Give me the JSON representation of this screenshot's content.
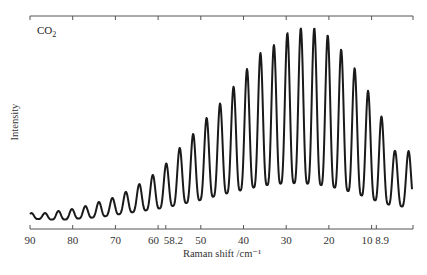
{
  "chart_data": {
    "type": "line",
    "title": "",
    "annotation": "CO2",
    "annotation_main": "CO",
    "annotation_sub": "2",
    "xlabel": "Raman shift /cm⁻¹",
    "ylabel": "Intensity",
    "xlim": [
      90,
      2
    ],
    "x_reversed": true,
    "grid": false,
    "legend": null,
    "x_ticks": [
      90,
      80,
      70,
      60,
      58.2,
      50,
      40,
      30,
      20,
      10,
      8.9
    ],
    "x_tick_labels": [
      "90",
      "80",
      "70",
      "60",
      "58.2",
      "50",
      "40",
      "30",
      "20",
      "10",
      "8.9"
    ],
    "top_ticks": [
      90,
      80,
      70,
      60,
      50,
      40,
      30,
      20,
      10,
      2
    ],
    "y_ticks": [],
    "series": [
      {
        "name": "CO2 rotational Raman spectrum",
        "peaks_raman_shift": [
          86.5,
          83.3,
          80.1,
          77.0,
          73.9,
          70.7,
          67.6,
          64.4,
          61.3,
          58.2,
          55.0,
          51.8,
          48.7,
          45.6,
          42.4,
          39.2,
          36.1,
          32.9,
          29.8,
          26.6,
          23.4,
          20.3,
          17.2,
          14.0,
          10.9,
          7.7,
          4.5
        ],
        "peaks_relative_intensity": [
          4.6,
          5.7,
          6.7,
          8.2,
          10.3,
          12.4,
          15.5,
          19.6,
          24.2,
          29.9,
          38.1,
          45.4,
          53.6,
          60.8,
          69.6,
          78.9,
          87.1,
          91.2,
          97.4,
          100,
          100,
          96.4,
          89.2,
          79.4,
          68.0,
          54.6,
          36.6
        ],
        "trough_relative_intensity": [
          1.5,
          1.0,
          1.5,
          2.0,
          2.5,
          3.5,
          4.5,
          5.5,
          6.5,
          7.5,
          9.0,
          10.5,
          12.0,
          14.0,
          15.5,
          17.0,
          18.5,
          19.5,
          20.0,
          20.0,
          19.5,
          18.5,
          17.0,
          15.0,
          12.5,
          10.0,
          8.0
        ]
      }
    ]
  }
}
